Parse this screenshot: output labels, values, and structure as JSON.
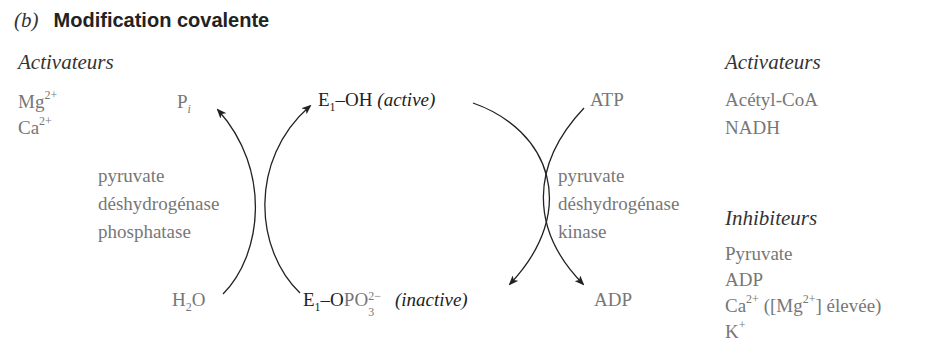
{
  "figure": {
    "panel_letter": "(b)",
    "title": "Modification covalente"
  },
  "left_regulators": {
    "heading": "Activateurs",
    "items": [
      {
        "base": "Mg",
        "sup": "2+"
      },
      {
        "base": "Ca",
        "sup": "2+"
      }
    ]
  },
  "right_regulators": {
    "activators_heading": "Activateurs",
    "activators": [
      "Acétyl-CoA",
      "NADH"
    ],
    "inhibitors_heading": "Inhibiteurs",
    "inhibitors": [
      {
        "base": "Pyruvate",
        "sup": ""
      },
      {
        "base": "ADP",
        "sup": ""
      },
      {
        "base": "Ca",
        "sup": "2+",
        "suffix_open": " ([Mg",
        "suffix_sup": "2+",
        "suffix_close": "] élevée)"
      },
      {
        "base": "K",
        "sup": "+"
      }
    ]
  },
  "cycle": {
    "top_enzyme": {
      "prefix": "E",
      "sub": "1",
      "group": "–OH",
      "state": "(active)"
    },
    "bottom_enzyme": {
      "prefix": "E",
      "sub": "1",
      "group_dark": "–O",
      "group_grey": "PO",
      "group_sub": "3",
      "group_sup": "2−",
      "state": "(inactive)"
    },
    "phosphatase": {
      "reactant": {
        "base": "H",
        "sub": "2",
        "tail": "O"
      },
      "product": {
        "base": "P",
        "sub": "i"
      },
      "enzyme_lines": [
        "pyruvate",
        "déshydrogénase",
        "phosphatase"
      ]
    },
    "kinase": {
      "reactant": "ATP",
      "product": "ADP",
      "enzyme_lines": [
        "pyruvate",
        "déshydrogénase",
        "kinase"
      ]
    }
  },
  "colors": {
    "dark_text": "#222222",
    "grey_text": "#777777",
    "arrow": "#222222",
    "background": "#ffffff"
  }
}
